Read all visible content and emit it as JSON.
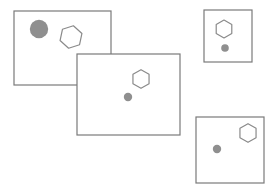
{
  "figure": {
    "type": "shape-arrangement",
    "canvas": {
      "width": 275,
      "height": 194,
      "background": "#ffffff"
    },
    "title": "",
    "colors": {
      "panel_stroke": "#7a7a7a",
      "panel_fill": "#ffffff",
      "shape_stroke": "#8a8a8a",
      "shape_fill": "#8f8f8f"
    },
    "counts": {
      "panels": 4,
      "circles": 4,
      "hexagons": 4
    },
    "panels": [
      {
        "name": "panel-top-left",
        "x": 14,
        "y": 11,
        "width": 97,
        "height": 74,
        "z": 1,
        "shapes": [
          {
            "name": "circle-filled-large",
            "kind": "circle",
            "cx": 39,
            "cy": 29,
            "r": 9.2,
            "fill": "#8f8f8f"
          },
          {
            "name": "hexagon-outline-large",
            "kind": "hexagon",
            "cx": 71,
            "cy": 37,
            "r": 11.5,
            "rotation": 12,
            "stroke": "#8a8a8a"
          }
        ]
      },
      {
        "name": "panel-top-right",
        "x": 204,
        "y": 10,
        "width": 48,
        "height": 52,
        "z": 2,
        "shapes": [
          {
            "name": "hexagon-outline-small",
            "kind": "hexagon",
            "cx": 224,
            "cy": 29,
            "r": 9.0,
            "rotation": 0,
            "stroke": "#8a8a8a"
          },
          {
            "name": "circle-filled-small",
            "kind": "circle",
            "cx": 225,
            "cy": 48,
            "r": 3.8,
            "fill": "#8f8f8f"
          }
        ]
      },
      {
        "name": "panel-center",
        "x": 77,
        "y": 54,
        "width": 103,
        "height": 81,
        "z": 3,
        "shapes": [
          {
            "name": "hexagon-outline-medium",
            "kind": "hexagon",
            "cx": 141,
            "cy": 79,
            "r": 9.3,
            "rotation": 0,
            "stroke": "#8a8a8a"
          },
          {
            "name": "circle-filled-medium",
            "kind": "circle",
            "cx": 128,
            "cy": 97,
            "r": 4.2,
            "fill": "#8f8f8f"
          }
        ]
      },
      {
        "name": "panel-bottom-right",
        "x": 196,
        "y": 117,
        "width": 68,
        "height": 66,
        "z": 4,
        "shapes": [
          {
            "name": "hexagon-outline-bottom",
            "kind": "hexagon",
            "cx": 248,
            "cy": 133,
            "r": 9.3,
            "rotation": 0,
            "stroke": "#8a8a8a"
          },
          {
            "name": "circle-filled-bottom",
            "kind": "circle",
            "cx": 217,
            "cy": 149,
            "r": 4.2,
            "fill": "#8f8f8f"
          }
        ]
      }
    ]
  }
}
